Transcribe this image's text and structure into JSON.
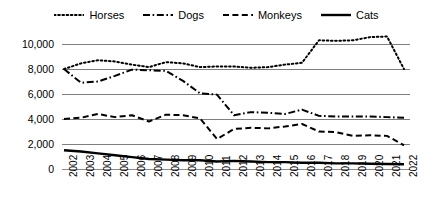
{
  "legend": {
    "position": "top",
    "items": [
      {
        "label": "Horses",
        "style": "dotted",
        "icon": "legend-line-dotted"
      },
      {
        "label": "Dogs",
        "style": "dashdot",
        "icon": "legend-line-dashdot"
      },
      {
        "label": "Monkeys",
        "style": "dashed",
        "icon": "legend-line-dashed"
      },
      {
        "label": "Cats",
        "style": "solid",
        "icon": "legend-line-solid"
      }
    ]
  },
  "axes": {
    "y_ticks": [
      "10,000",
      "8,000",
      "6,000",
      "4,000",
      "2,000",
      "0"
    ],
    "x_ticks": [
      "2002",
      "2003",
      "2004",
      "2005",
      "2006",
      "2007",
      "2008",
      "2009",
      "2010",
      "2011",
      "2012",
      "2013",
      "2014",
      "2015",
      "2016",
      "2017",
      "2018",
      "2019",
      "2020",
      "2021",
      "2022"
    ]
  },
  "chart_data": {
    "type": "line",
    "title": "",
    "subtitle": "",
    "xlabel": "",
    "ylabel": "",
    "ylim": [
      0,
      10000
    ],
    "ytick_step": 2000,
    "grid": "horizontal",
    "legend_position": "top",
    "x": [
      2002,
      2003,
      2004,
      2005,
      2006,
      2007,
      2008,
      2009,
      2010,
      2011,
      2012,
      2013,
      2014,
      2015,
      2016,
      2017,
      2018,
      2019,
      2020,
      2021,
      2022
    ],
    "series": [
      {
        "name": "Horses",
        "style": "dotted",
        "color": "#000000",
        "values": [
          8000,
          8450,
          8700,
          8600,
          8350,
          8150,
          8550,
          8450,
          8150,
          8200,
          8200,
          8100,
          8150,
          8350,
          8500,
          10300,
          10250,
          10300,
          10550,
          10600,
          8000
        ]
      },
      {
        "name": "Dogs",
        "style": "dashdot",
        "color": "#000000",
        "values": [
          8000,
          6900,
          7000,
          7450,
          7950,
          7900,
          7850,
          7050,
          6050,
          5950,
          4300,
          4550,
          4500,
          4400,
          4750,
          4250,
          4200,
          4200,
          4200,
          4150,
          4100
        ]
      },
      {
        "name": "Monkeys",
        "style": "dashed",
        "color": "#000000",
        "values": [
          4000,
          4100,
          4400,
          4150,
          4300,
          3800,
          4350,
          4300,
          4050,
          2400,
          3200,
          3300,
          3250,
          3400,
          3600,
          3000,
          2950,
          2650,
          2700,
          2650,
          1900
        ]
      },
      {
        "name": "Cats",
        "style": "solid",
        "color": "#000000",
        "values": [
          1500,
          1400,
          1250,
          1100,
          950,
          800,
          750,
          700,
          700,
          600,
          650,
          600,
          550,
          550,
          500,
          500,
          450,
          450,
          420,
          400,
          380
        ]
      }
    ]
  }
}
